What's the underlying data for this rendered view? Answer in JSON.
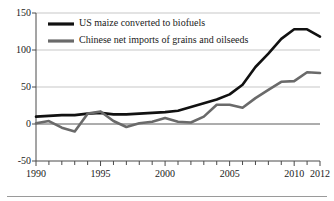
{
  "chart_data": {
    "type": "line",
    "title": "",
    "subtitle": "",
    "xlabel": "",
    "ylabel": "",
    "xlim": [
      1990,
      2012
    ],
    "ylim": [
      -50,
      150
    ],
    "yticks": [
      -50,
      0,
      50,
      100,
      150
    ],
    "ytick_labels": [
      "-50",
      "0",
      "50",
      "100",
      "150"
    ],
    "xticks": [
      1990,
      1995,
      2000,
      2005,
      2010,
      2012
    ],
    "xtick_labels": [
      "1990",
      "1995",
      "2000",
      "2005",
      "2010",
      "2012"
    ],
    "minor_xticks_every": 1,
    "grid": "horizontal",
    "legend_position": "top-left-inside",
    "x": [
      1990,
      1991,
      1992,
      1993,
      1994,
      1995,
      1996,
      1997,
      1998,
      1999,
      2000,
      2001,
      2002,
      2003,
      2004,
      2005,
      2006,
      2007,
      2008,
      2009,
      2010,
      2011,
      2012
    ],
    "series": [
      {
        "name": "US maize converted to biofuels",
        "color": "#111111",
        "linewidth": 2.6,
        "values": [
          10,
          11,
          12,
          12,
          14,
          15,
          13,
          13,
          14,
          15,
          16,
          18,
          23,
          28,
          33,
          40,
          53,
          77,
          95,
          115,
          128,
          128,
          118
        ]
      },
      {
        "name": "Chinese net imports of grains and oilseeds",
        "color": "#6a6a6a",
        "linewidth": 2.6,
        "values": [
          1,
          4,
          -5,
          -10,
          14,
          17,
          4,
          -4,
          1,
          3,
          8,
          3,
          2,
          10,
          26,
          26,
          22,
          35,
          46,
          57,
          58,
          70,
          69
        ]
      }
    ]
  },
  "axis": {
    "ytick_labels": [
      "150",
      "100",
      "50",
      "0",
      "-50"
    ],
    "xtick_labels": [
      "1990",
      "1995",
      "2000",
      "2005",
      "2010",
      "2012"
    ]
  },
  "legend": {
    "items": [
      {
        "label": "US maize converted to biofuels",
        "color": "#111111"
      },
      {
        "label": "Chinese net imports of grains and oilseeds",
        "color": "#6a6a6a"
      }
    ]
  }
}
